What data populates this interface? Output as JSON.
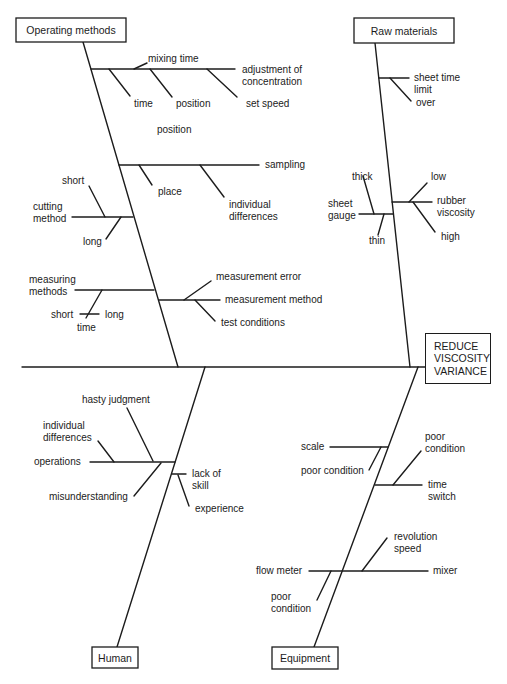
{
  "effect": {
    "label": "REDUCE\nVISCOSITY\nVARIANCE"
  },
  "categories": {
    "operating_methods": {
      "label": "Operating methods",
      "causes": {
        "mixing_time": "mixing time",
        "adjustment": "adjustment of\nconcentration",
        "time": "time",
        "position_a": "position",
        "set_speed": "set speed",
        "position_b": "position",
        "sampling": "sampling",
        "place": "place",
        "individual_differences": "individual\ndifferences",
        "short": "short",
        "cutting_method": "cutting\nmethod",
        "long": "long",
        "measuring_methods": "measuring\nmethods",
        "short2": "short",
        "long2": "long",
        "time2": "time",
        "measurement_error": "measurement error",
        "measurement_method": "measurement method",
        "test_conditions": "test conditions"
      }
    },
    "raw_materials": {
      "label": "Raw materials",
      "causes": {
        "sheet_time_limit": "sheet time\nlimit",
        "over": "over",
        "thick": "thick",
        "sheet_gauge": "sheet\ngauge",
        "thin": "thin",
        "low": "low",
        "rubber_viscosity": "rubber\nviscosity",
        "high": "high"
      }
    },
    "human": {
      "label": "Human",
      "causes": {
        "hasty_judgment": "hasty judgment",
        "individual_differences": "individual\ndifferences",
        "operations": "operations",
        "misunderstanding": "misunderstanding",
        "lack_of_skill": "lack of\nskill",
        "experience": "experience"
      }
    },
    "equipment": {
      "label": "Equipment",
      "causes": {
        "scale": "scale",
        "poor_condition_a": "poor condition",
        "poor_condition_b": "poor\ncondition",
        "time_switch": "time\nswitch",
        "revolution_speed": "revolution\nspeed",
        "flow_meter": "flow meter",
        "mixer": "mixer",
        "poor_condition_c": "poor\ncondition"
      }
    }
  },
  "colors": {
    "line": "#1c1c1c",
    "text": "#222222",
    "background": "#ffffff"
  }
}
